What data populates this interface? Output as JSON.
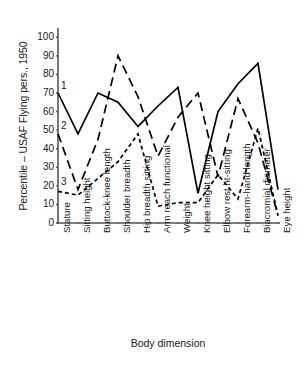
{
  "chart_data": {
    "type": "line",
    "title": "",
    "xlabel": "Body dimension",
    "ylabel": "Percentile – USAF Flying pers., 1950",
    "ylim": [
      0,
      105
    ],
    "yticks": [
      0,
      10,
      20,
      30,
      40,
      50,
      60,
      70,
      80,
      90,
      100
    ],
    "grid": false,
    "legend_position": "inline-left-annotations",
    "categories": [
      "Stature",
      "Sitting height",
      "Buttock-knee length",
      "Shoulder breadth",
      "Hip breadth sitting",
      "Arm reach functional",
      "Weight",
      "Knee height sitting",
      "Elbow rest ht-sitting",
      "Forearm-hand length",
      "Biacromial diameter",
      "Eye height"
    ],
    "series": [
      {
        "name": "1",
        "style": "solid",
        "values": [
          70,
          48,
          70,
          65,
          52,
          63,
          73,
          16,
          60,
          75,
          86,
          18
        ]
      },
      {
        "name": "2",
        "style": "long-dash",
        "values": [
          48,
          18,
          45,
          90,
          68,
          36,
          57,
          70,
          25,
          67,
          43,
          4
        ]
      },
      {
        "name": "3",
        "style": "short-dash",
        "values": [
          17,
          15,
          24,
          33,
          48,
          9,
          11,
          11,
          26,
          13,
          51,
          4
        ]
      }
    ],
    "annotations": [
      {
        "text": "1",
        "x_value": "Stature",
        "y_value": 74
      },
      {
        "text": "2",
        "x_value": "Stature",
        "y_value": 52
      },
      {
        "text": "3",
        "x_value": "Stature",
        "y_value": 22
      }
    ]
  }
}
